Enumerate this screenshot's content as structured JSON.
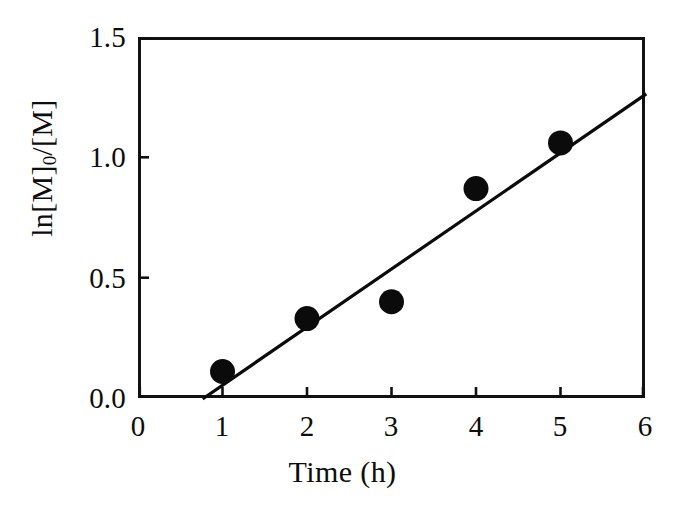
{
  "figure": {
    "background_color": "#ffffff",
    "ink_color": "#0b0b0b"
  },
  "chart_data": {
    "type": "scatter",
    "title": "",
    "subtitle": "",
    "xlabel": "Time (h)",
    "ylabel": "ln[M]0/[M]",
    "ylabel_parts": {
      "before_sub": "ln[M]",
      "sub": "0",
      "after_sub": "/[M]"
    },
    "xlim": [
      0,
      6
    ],
    "ylim": [
      0.0,
      1.5
    ],
    "xticks": [
      0,
      1,
      2,
      3,
      4,
      5,
      6
    ],
    "xtick_labels": [
      "0",
      "1",
      "2",
      "3",
      "4",
      "5",
      "6"
    ],
    "yticks": [
      0.0,
      0.5,
      1.0,
      1.5
    ],
    "ytick_labels": [
      "0.0",
      "0.5",
      "1.0",
      "1.5"
    ],
    "grid": false,
    "legend": null,
    "legend_position": "none",
    "marker": "filled-circle",
    "x": [
      1,
      2,
      3,
      4,
      5
    ],
    "values": [
      0.11,
      0.33,
      0.4,
      0.87,
      1.06
    ],
    "series": [
      {
        "name": "ln[M]0/[M] vs Time",
        "marker": "filled-circle",
        "points": [
          {
            "x": 1,
            "y": 0.11
          },
          {
            "x": 2,
            "y": 0.33
          },
          {
            "x": 3,
            "y": 0.4
          },
          {
            "x": 4,
            "y": 0.87
          },
          {
            "x": 5,
            "y": 1.06
          }
        ]
      }
    ],
    "fit_line": {
      "type": "linear",
      "x_start": 0.78,
      "y_start": 0.0,
      "x_end": 6.0,
      "y_end": 1.26,
      "slope": 0.2414,
      "intercept": -0.1883
    },
    "annotations": []
  }
}
